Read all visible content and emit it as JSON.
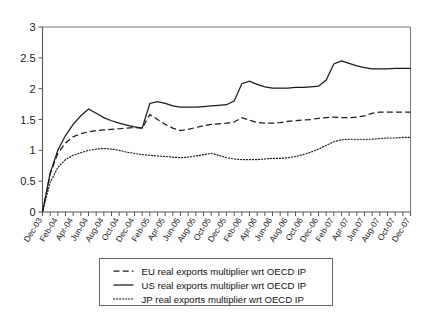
{
  "chart_data": {
    "type": "line",
    "title": "",
    "xlabel": "",
    "ylabel": "",
    "ylim": [
      0,
      3
    ],
    "yticks": [
      "0",
      "0.5",
      "1",
      "1.5",
      "2",
      "2.5",
      "3"
    ],
    "ytick_values": [
      0,
      0.5,
      1,
      1.5,
      2,
      2.5,
      3
    ],
    "grid": false,
    "legend_position": "below-plot",
    "categories": [
      "Dec-03",
      "Jan-04",
      "Feb-04",
      "Mar-04",
      "Apr-04",
      "May-04",
      "Jun-04",
      "Jul-04",
      "Aug-04",
      "Sep-04",
      "Oct-04",
      "Nov-04",
      "Dec-04",
      "Jan-05",
      "Feb-05",
      "Mar-05",
      "Apr-05",
      "May-05",
      "Jun-05",
      "Jul-05",
      "Aug-05",
      "Sep-05",
      "Oct-05",
      "Nov-05",
      "Dec-05",
      "Jan-06",
      "Feb-06",
      "Mar-06",
      "Apr-06",
      "May-06",
      "Jun-06",
      "Jul-06",
      "Aug-06",
      "Sep-06",
      "Oct-06",
      "Nov-06",
      "Dec-06",
      "Jan-07",
      "Feb-07",
      "Mar-07",
      "Apr-07",
      "May-07",
      "Jun-07",
      "Jul-07",
      "Aug-07",
      "Sep-07",
      "Oct-07",
      "Nov-07",
      "Dec-07"
    ],
    "xtick_labels": [
      "Dec-03",
      "Feb-04",
      "Apr-04",
      "Jun-04",
      "Aug-04",
      "Oct-04",
      "Dec-04",
      "Feb-05",
      "Apr-05",
      "Jun-05",
      "Aug-05",
      "Oct-05",
      "Dec-05",
      "Feb-06",
      "Apr-06",
      "Jun-06",
      "Aug-06",
      "Oct-06",
      "Dec-06",
      "Feb-07",
      "Apr-07",
      "Jun-07",
      "Aug-07",
      "Oct-07",
      "Dec-07"
    ],
    "series": [
      {
        "name": "EU real exports multiplier wrt OECD IP",
        "key": "EU",
        "style": "dashed",
        "color": "#1a1a1a",
        "values": [
          0.0,
          0.62,
          0.95,
          1.12,
          1.22,
          1.27,
          1.3,
          1.32,
          1.33,
          1.34,
          1.35,
          1.36,
          1.37,
          1.36,
          1.58,
          1.5,
          1.42,
          1.36,
          1.32,
          1.34,
          1.37,
          1.4,
          1.42,
          1.43,
          1.44,
          1.46,
          1.53,
          1.49,
          1.45,
          1.44,
          1.44,
          1.45,
          1.47,
          1.48,
          1.49,
          1.5,
          1.52,
          1.53,
          1.54,
          1.53,
          1.53,
          1.54,
          1.56,
          1.6,
          1.62,
          1.62,
          1.62,
          1.62,
          1.62
        ]
      },
      {
        "name": "US real exports multiplier wrt OECD IP",
        "key": "US",
        "style": "solid",
        "color": "#1a1a1a",
        "values": [
          0.0,
          0.63,
          1.0,
          1.24,
          1.42,
          1.56,
          1.67,
          1.6,
          1.53,
          1.48,
          1.44,
          1.41,
          1.38,
          1.36,
          1.76,
          1.79,
          1.76,
          1.72,
          1.7,
          1.7,
          1.7,
          1.71,
          1.72,
          1.73,
          1.74,
          1.8,
          2.08,
          2.12,
          2.07,
          2.03,
          2.01,
          2.01,
          2.01,
          2.02,
          2.02,
          2.03,
          2.04,
          2.14,
          2.4,
          2.45,
          2.41,
          2.37,
          2.34,
          2.32,
          2.32,
          2.32,
          2.33,
          2.33,
          2.33
        ]
      },
      {
        "name": "JP real exports multiplier wrt OECD IP",
        "key": "JP",
        "style": "dotted",
        "color": "#1a1a1a",
        "values": [
          0.0,
          0.48,
          0.72,
          0.85,
          0.92,
          0.96,
          1.0,
          1.02,
          1.03,
          1.02,
          1.0,
          0.97,
          0.95,
          0.93,
          0.92,
          0.91,
          0.9,
          0.89,
          0.88,
          0.89,
          0.91,
          0.93,
          0.95,
          0.92,
          0.88,
          0.86,
          0.85,
          0.85,
          0.85,
          0.86,
          0.87,
          0.87,
          0.88,
          0.9,
          0.93,
          0.97,
          1.02,
          1.08,
          1.14,
          1.17,
          1.18,
          1.18,
          1.18,
          1.18,
          1.19,
          1.2,
          1.2,
          1.21,
          1.21
        ]
      }
    ]
  },
  "legend": {
    "entries": [
      {
        "marker": "dashed",
        "label": "EU real exports multiplier wrt OECD IP"
      },
      {
        "marker": "solid",
        "label": "US real exports multiplier wrt OECD IP"
      },
      {
        "marker": "dotted",
        "label": "JP real exports multiplier wrt OECD IP"
      }
    ]
  }
}
